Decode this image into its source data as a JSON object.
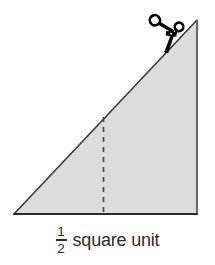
{
  "figure": {
    "background_color": "#ffffff",
    "triangle": {
      "name": "right-triangle",
      "fill_color": "#dcdcdc",
      "stroke_color": "#3a3a3a",
      "base_stroke_color": "#2b2b2b",
      "vertices": {
        "left_base": [
          14,
          214
        ],
        "right_base": [
          197,
          214
        ],
        "apex": [
          197,
          20
        ]
      },
      "base_length_px": 183,
      "height_px": 194
    },
    "dashed_line": {
      "name": "dashed-cut-line",
      "x": 103,
      "y_top": 117,
      "y_bottom": 214,
      "color": "#4a4a4a",
      "dash_pattern": "5 5"
    },
    "scissors": {
      "name": "scissors-icon",
      "color": "#000000",
      "position": [
        172,
        32
      ],
      "rotation_deg": -28
    }
  },
  "caption": {
    "fraction": {
      "numerator": "1",
      "denominator": "2"
    },
    "text": "square unit",
    "full_text": "1/2 square unit",
    "color": "#2b2b2b"
  }
}
